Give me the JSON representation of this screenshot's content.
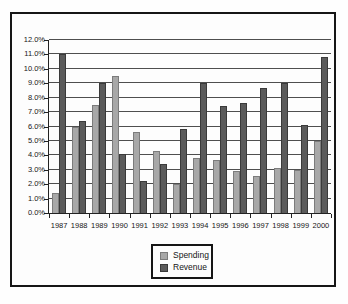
{
  "chart_data": {
    "type": "bar",
    "title": "",
    "xlabel": "",
    "ylabel": "",
    "categories": [
      "1987",
      "1988",
      "1989",
      "1990",
      "1991",
      "1992",
      "1993",
      "1994",
      "1995",
      "1996",
      "1997",
      "1998",
      "1999",
      "2000"
    ],
    "series": [
      {
        "name": "Spending",
        "color": "#a8a8a8",
        "border_color": "#7c7c7c",
        "values": [
          1.4,
          6.0,
          7.5,
          9.5,
          5.6,
          4.3,
          2.0,
          3.8,
          3.7,
          2.9,
          2.6,
          3.1,
          3.0,
          5.0
        ]
      },
      {
        "name": "Revenue",
        "color": "#5b5b5b",
        "border_color": "#3a3a3a",
        "values": [
          11.0,
          6.4,
          9.0,
          4.1,
          2.2,
          3.4,
          5.8,
          9.0,
          7.4,
          7.6,
          8.7,
          9.0,
          6.1,
          10.8
        ]
      }
    ],
    "ylim": [
      0,
      12
    ],
    "ytick_step": 1,
    "ytick_labels": [
      "0.0%",
      "1.0%",
      "2.0%",
      "3.0%",
      "4.0%",
      "5.0%",
      "6.0%",
      "7.0%",
      "8.0%",
      "9.0%",
      "10.0%",
      "11.0%",
      "12.0%"
    ],
    "grid": true,
    "legend_position": "bottom-center",
    "colors": {
      "gridline": "#4e4e4e",
      "axis": "#222222",
      "frame_border": "#161616",
      "plot_background": "#fdfdfd",
      "text": "#161616"
    }
  }
}
